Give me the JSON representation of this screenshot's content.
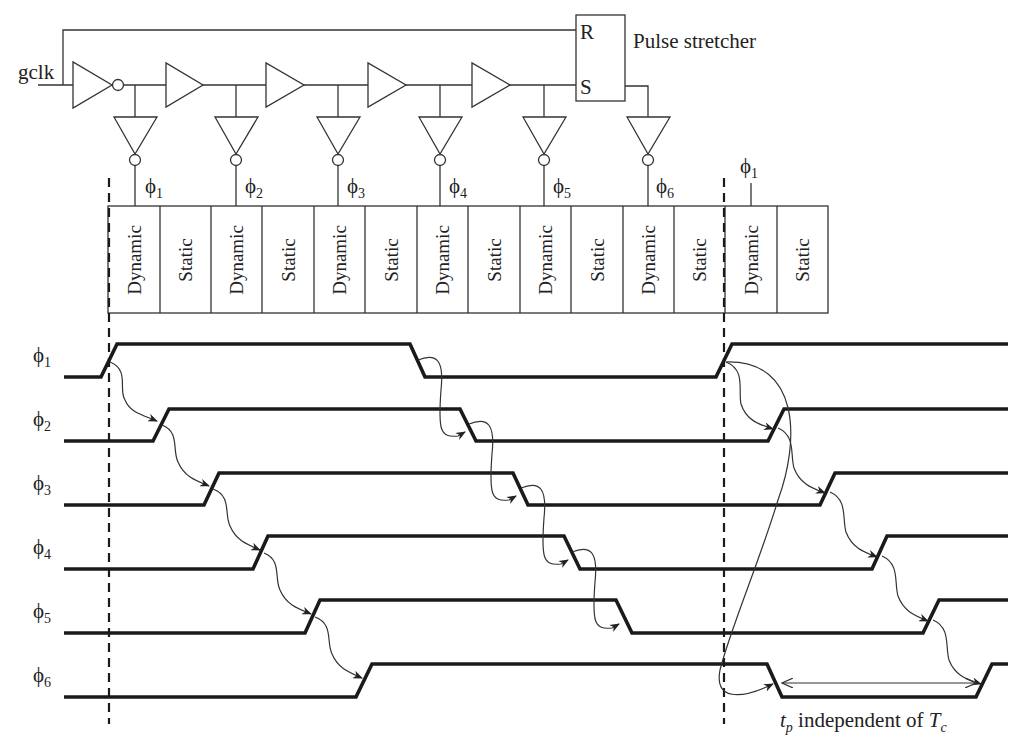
{
  "circuit": {
    "input_label": "gclk",
    "pulse_stretcher": {
      "label": "Pulse stretcher",
      "reset_pin": "R",
      "set_pin": "S"
    },
    "phase_symbol": "ϕ",
    "taps": [
      {
        "sub": "1"
      },
      {
        "sub": "2"
      },
      {
        "sub": "3"
      },
      {
        "sub": "4"
      },
      {
        "sub": "5"
      },
      {
        "sub": "6"
      }
    ],
    "next_cycle_tap": {
      "sub": "1"
    }
  },
  "pipeline": {
    "cells": [
      "Dynamic",
      "Static",
      "Dynamic",
      "Static",
      "Dynamic",
      "Static",
      "Dynamic",
      "Static",
      "Dynamic",
      "Static",
      "Dynamic",
      "Static",
      "Dynamic",
      "Static"
    ]
  },
  "timing": {
    "signals": [
      {
        "name": "ϕ",
        "sub": "1"
      },
      {
        "name": "ϕ",
        "sub": "2"
      },
      {
        "name": "ϕ",
        "sub": "3"
      },
      {
        "name": "ϕ",
        "sub": "4"
      },
      {
        "name": "ϕ",
        "sub": "5"
      },
      {
        "name": "ϕ",
        "sub": "6"
      }
    ],
    "annotation": {
      "tp_main": "t",
      "tp_sub": "p",
      "middle": " independent of ",
      "tc_main": "T",
      "tc_sub": "c"
    }
  }
}
